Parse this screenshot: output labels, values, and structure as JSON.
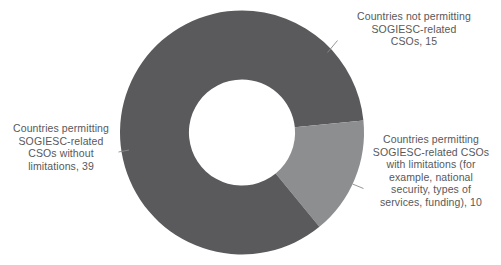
{
  "chart_data": {
    "type": "pie",
    "variant": "donut",
    "title": "",
    "xlabel": "",
    "ylabel": "",
    "total": 64,
    "hole_ratio": 0.435,
    "start_angle_deg": 0,
    "direction": "clockwise",
    "legend": "none",
    "grid": false,
    "categories": [
      "Countries not permitting SOGIESC-related CSOs",
      "Countries permitting SOGIESC-related CSOs with limitations (for example, national security, types of services, funding)",
      "Countries permitting SOGIESC-related CSOs without limitations"
    ],
    "values": [
      15,
      10,
      39
    ],
    "colors": [
      "#5a5a5c",
      "#8d8e90",
      "#5a5a5c"
    ],
    "slices": [
      {
        "name": "Countries not permitting SOGIESC-related CSOs",
        "value": 15,
        "color": "#5a5a5c",
        "start_deg": 0,
        "end_deg": 84.375,
        "label_text": "Countries not permitting\nSOGIESC-related\nCSOs, 15"
      },
      {
        "name": "Countries permitting SOGIESC-related CSOs with limitations (for example, national security, types of services, funding)",
        "value": 10,
        "color": "#8d8e90",
        "start_deg": 84.375,
        "end_deg": 140.625,
        "label_text": "Countries permitting\nSOGIESC-related CSOs\nwith limitations (for\nexample, national\nsecurity, types of\nservices, funding), 10"
      },
      {
        "name": "Countries permitting SOGIESC-related CSOs without limitations",
        "value": 39,
        "color": "#5a5a5c",
        "start_deg": 140.625,
        "end_deg": 360,
        "label_text": "Countries permitting\nSOGIESC-related\nCSOs without\nlimitations, 39"
      }
    ]
  },
  "labels": {
    "not_permitting": "Countries not permitting\nSOGIESC-related\nCSOs, 15",
    "with_limitations": "Countries permitting\nSOGIESC-related CSOs\nwith limitations (for\nexample, national\nsecurity, types of\nservices, funding), 10",
    "without_limitations": "Countries permitting\nSOGIESC-related\nCSOs without\nlimitations, 39"
  },
  "style": {
    "background": "#ffffff",
    "text_color": "#58585a",
    "leader_line_color": "#8a8a8c",
    "dark_slice_color": "#5a5a5c",
    "light_slice_color": "#8d8e90"
  }
}
